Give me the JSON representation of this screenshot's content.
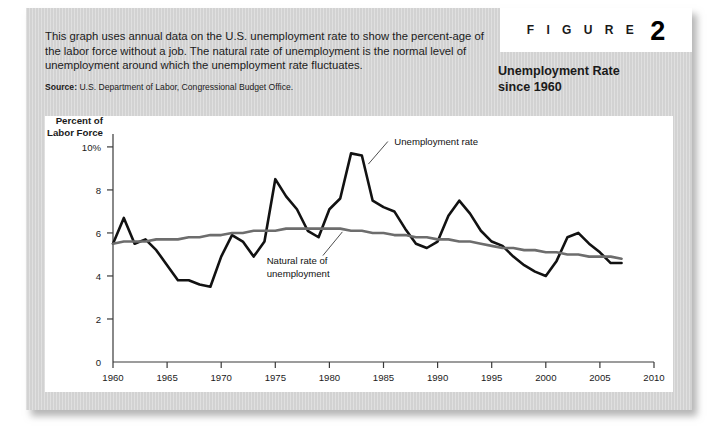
{
  "figure": {
    "tag_word": "F I G U R E",
    "number": "2",
    "title_line1": "Unemployment Rate",
    "title_line2": "since 1960",
    "intro": "This graph uses annual data on the U.S. unemployment rate to show the percent-age of the labor force without a job. The natural rate of unemployment is the normal level of unemployment around which the unemployment rate fluctuates.",
    "source_label": "Source:",
    "source_text": "U.S. Department of Labor, Congressional Budget Office."
  },
  "chart_data": {
    "type": "line",
    "title": "Unemployment Rate since 1960",
    "xlabel": "",
    "ylabel": "Percent of Labor Force",
    "ylabel_line1": "Percent of",
    "ylabel_line2": "Labor Force",
    "xlim": [
      1960,
      2010
    ],
    "ylim": [
      0,
      10.6
    ],
    "grid": false,
    "legend_position": "inline-annotations",
    "xticks": [
      1960,
      1965,
      1970,
      1975,
      1980,
      1985,
      1990,
      1995,
      2000,
      2005,
      2010
    ],
    "xtick_labels": [
      "1960",
      "1965",
      "1970",
      "1975",
      "1980",
      "1985",
      "1990",
      "1995",
      "2000",
      "2005",
      "2010"
    ],
    "yticks": [
      0,
      2,
      4,
      6,
      8,
      10
    ],
    "ytick_labels": [
      "0",
      "2",
      "4",
      "6",
      "8",
      "10%"
    ],
    "annotations": [
      {
        "text": "Unemployment rate",
        "series": "unemployment"
      },
      {
        "text_line1": "Natural rate of",
        "text_line2": "unemployment",
        "series": "natural"
      }
    ],
    "x": [
      1960,
      1961,
      1962,
      1963,
      1964,
      1965,
      1966,
      1967,
      1968,
      1969,
      1970,
      1971,
      1972,
      1973,
      1974,
      1975,
      1976,
      1977,
      1978,
      1979,
      1980,
      1981,
      1982,
      1983,
      1984,
      1985,
      1986,
      1987,
      1988,
      1989,
      1990,
      1991,
      1992,
      1993,
      1994,
      1995,
      1996,
      1997,
      1998,
      1999,
      2000,
      2001,
      2002,
      2003,
      2004,
      2005,
      2006,
      2007
    ],
    "series": [
      {
        "name": "Unemployment rate",
        "color": "#121212",
        "values": [
          5.5,
          6.7,
          5.5,
          5.7,
          5.2,
          4.5,
          3.8,
          3.8,
          3.6,
          3.5,
          4.9,
          5.9,
          5.6,
          4.9,
          5.6,
          8.5,
          7.7,
          7.1,
          6.1,
          5.8,
          7.1,
          7.6,
          9.7,
          9.6,
          7.5,
          7.2,
          7.0,
          6.2,
          5.5,
          5.3,
          5.6,
          6.8,
          7.5,
          6.9,
          6.1,
          5.6,
          5.4,
          4.9,
          4.5,
          4.2,
          4.0,
          4.7,
          5.8,
          6.0,
          5.5,
          5.1,
          4.6,
          4.6
        ]
      },
      {
        "name": "Natural rate of unemployment",
        "color": "#6d6d6d",
        "values": [
          5.5,
          5.6,
          5.6,
          5.6,
          5.7,
          5.7,
          5.7,
          5.8,
          5.8,
          5.9,
          5.9,
          6.0,
          6.0,
          6.1,
          6.1,
          6.1,
          6.2,
          6.2,
          6.2,
          6.2,
          6.2,
          6.2,
          6.1,
          6.1,
          6.0,
          6.0,
          5.9,
          5.9,
          5.8,
          5.8,
          5.7,
          5.7,
          5.6,
          5.6,
          5.5,
          5.4,
          5.3,
          5.3,
          5.2,
          5.2,
          5.1,
          5.1,
          5.0,
          5.0,
          4.9,
          4.9,
          4.9,
          4.8
        ]
      }
    ]
  }
}
